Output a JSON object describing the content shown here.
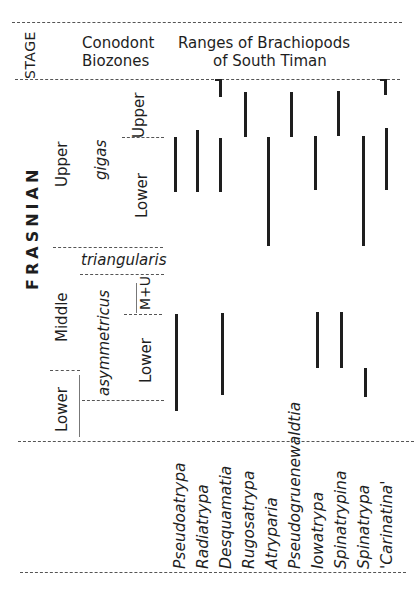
{
  "header": {
    "stage_label": "STAGE",
    "conodont_label_line1": "Conodont",
    "conodont_label_line2": "Biozones",
    "ranges_title_line1": "Ranges of Brachiopods",
    "ranges_title_line2": "of South Timan"
  },
  "stage": {
    "name": "FRASNIAN",
    "substages": [
      "Upper",
      "Middle",
      "Lower"
    ]
  },
  "biozones": {
    "zones": [
      "gigas",
      "triangularis",
      "asymmetricus"
    ],
    "subzones": {
      "gigas": [
        "Upper",
        "Lower"
      ],
      "asymmetricus": [
        "M+U",
        "Lower"
      ]
    }
  },
  "taxa": [
    {
      "name": "Pseudoatrypa",
      "ranges": [
        [
          232,
          396
        ],
        [
          315,
          410
        ]
      ]
    },
    {
      "name": "Radiatrypa",
      "ranges": [
        [
          230,
          392
        ]
      ]
    },
    {
      "name": "Desquamatia",
      "ranges": [
        [
          78,
          97
        ],
        [
          139,
          193
        ],
        [
          312,
          392
        ]
      ]
    },
    {
      "name": "Rugosatrypa",
      "ranges": [
        [
          92,
          137
        ]
      ]
    },
    {
      "name": "Atryparia",
      "ranges": [
        [
          137,
          245
        ]
      ]
    },
    {
      "name": "Pseudogruenewaldtia",
      "ranges": [
        [
          92,
          137
        ]
      ]
    },
    {
      "name": "Iowatrypa",
      "ranges": [
        [
          136,
          189
        ],
        [
          311,
          367
        ]
      ]
    },
    {
      "name": "Spinatrypina",
      "ranges": [
        [
          91,
          135
        ],
        [
          311,
          367
        ]
      ]
    },
    {
      "name": "Spinatrypa",
      "ranges": [
        [
          136,
          245
        ],
        [
          368,
          396
        ]
      ]
    },
    {
      "name": "'Carinatina'",
      "ranges": [
        [
          78,
          94
        ],
        [
          128,
          190
        ]
      ]
    }
  ],
  "taxon_labels": [
    "Pseudoatrypa",
    "Radiatrypa",
    "Desquamatia",
    "Rugosatrypa",
    "Atryparia",
    "Pseudogruenewaldtia",
    "Iowatrypa",
    "Spinatrypina",
    "Spinatrypa",
    "'Carinatina'"
  ]
}
